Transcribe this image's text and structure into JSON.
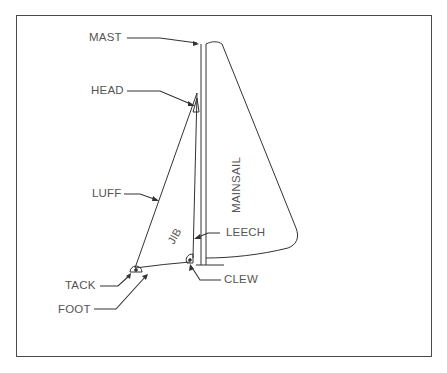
{
  "diagram": {
    "type": "sailboat-rig-diagram",
    "labels": {
      "mast": "MAST",
      "head": "HEAD",
      "luff": "LUFF",
      "jib": "JIB",
      "mainsail": "MAINSAIL",
      "leech": "LEECH",
      "tack": "TACK",
      "clew": "CLEW",
      "foot": "FOOT"
    },
    "colors": {
      "stroke": "#333333",
      "text": "#555555",
      "frame": "#4a4a4a",
      "background": "#ffffff"
    }
  }
}
